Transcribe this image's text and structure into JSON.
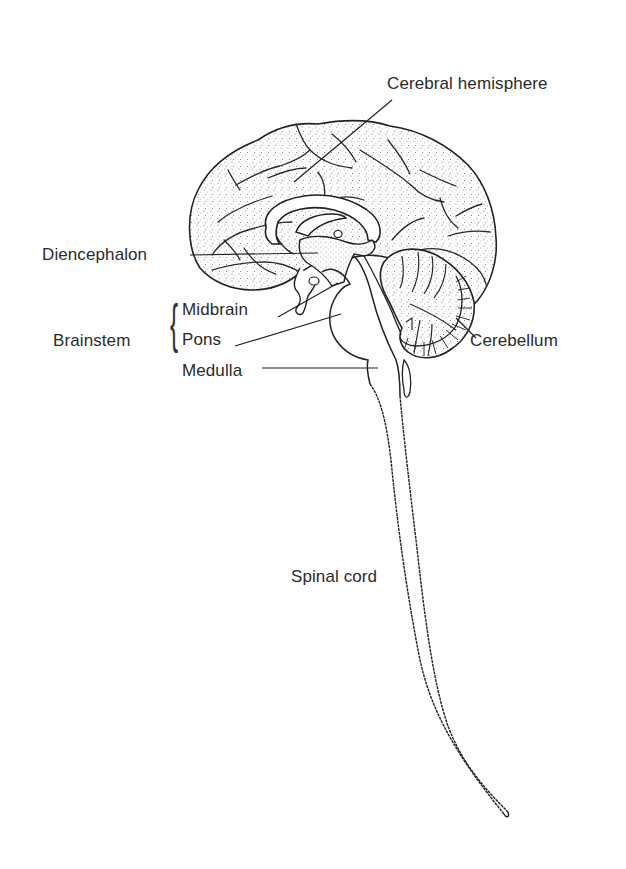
{
  "figure": {
    "colors": {
      "outline": "#222222",
      "stipple": "#777777",
      "background": "#ffffff",
      "text": "#2b2b2b"
    }
  },
  "labels": {
    "cerebral_hemisphere": "Cerebral hemisphere",
    "diencephalon": "Diencephalon",
    "brainstem": "Brainstem",
    "midbrain": "Midbrain",
    "pons": "Pons",
    "medulla": "Medulla",
    "cerebellum": "Cerebellum",
    "spinal_cord": "Spinal cord"
  },
  "groups": {
    "brainstem": {
      "label": "Brainstem",
      "members": [
        "Midbrain",
        "Pons",
        "Medulla"
      ]
    }
  }
}
